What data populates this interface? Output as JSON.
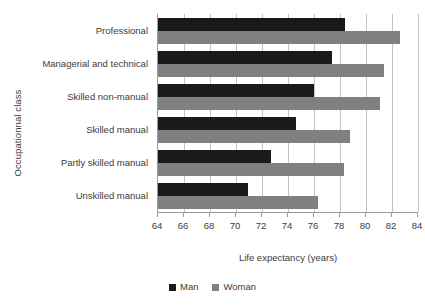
{
  "chart_data": {
    "type": "bar",
    "orientation": "horizontal",
    "title": "",
    "xlabel": "Life expectancy (years)",
    "ylabel": "Occupationnal class",
    "xlim": [
      64,
      84
    ],
    "xticks": [
      64,
      66,
      68,
      70,
      72,
      74,
      76,
      78,
      80,
      82,
      84
    ],
    "grid": "vertical",
    "legend_position": "bottom-center",
    "categories": [
      "Professional",
      "Managerial and technical",
      "Skilled non-manual",
      "Skilled manual",
      "Partly skilled manual",
      "Unskilled manual"
    ],
    "series": [
      {
        "name": "Man",
        "color": "#1a1a1a",
        "values": [
          78.4,
          77.4,
          76.0,
          74.6,
          72.7,
          70.9
        ]
      },
      {
        "name": "Woman",
        "color": "#808080",
        "values": [
          82.6,
          81.4,
          81.1,
          78.8,
          78.3,
          76.3
        ]
      }
    ]
  },
  "axes": {
    "x_title": "Life expectancy (years)",
    "y_title": "Occupationnal class"
  },
  "legend": {
    "items": [
      {
        "label": "Man",
        "color": "#1a1a1a",
        "swatch": "square-swatch-black"
      },
      {
        "label": "Woman",
        "color": "#808080",
        "swatch": "square-swatch-gray"
      }
    ]
  },
  "colors": {
    "man": "#1a1a1a",
    "woman": "#808080",
    "gridline": "#c3c3c3",
    "axis": "#9a9a9a",
    "text": "#3b3b3b",
    "background": "#ffffff"
  }
}
